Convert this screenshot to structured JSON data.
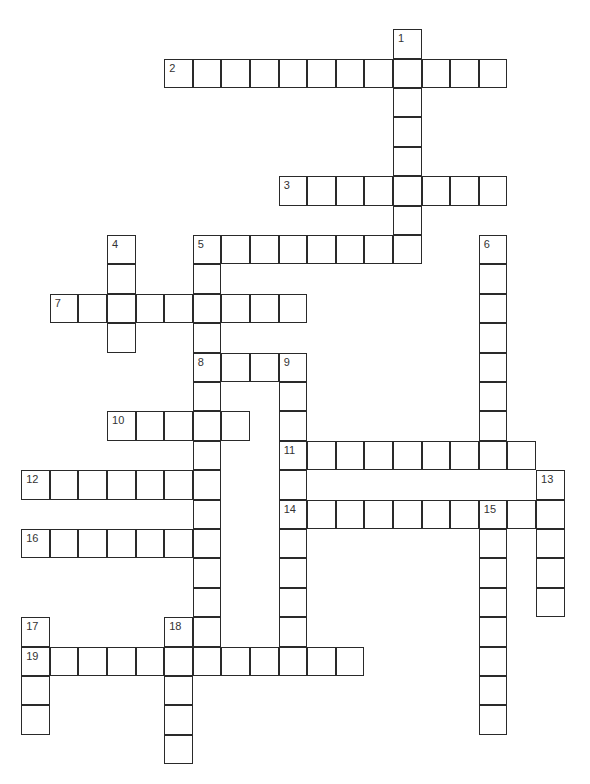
{
  "puzzle": {
    "type": "crossword",
    "entries": [
      {
        "number": "1",
        "direction": "down",
        "row": 0,
        "col": 13,
        "length": 8
      },
      {
        "number": "2",
        "direction": "across",
        "row": 1,
        "col": 5,
        "length": 12
      },
      {
        "number": "3",
        "direction": "across",
        "row": 5,
        "col": 9,
        "length": 8
      },
      {
        "number": "4",
        "direction": "down",
        "row": 7,
        "col": 3,
        "length": 4
      },
      {
        "number": "5",
        "direction": "across",
        "row": 7,
        "col": 6,
        "length": 8
      },
      {
        "number": "5",
        "direction": "down",
        "row": 7,
        "col": 6,
        "length": 14
      },
      {
        "number": "6",
        "direction": "down",
        "row": 7,
        "col": 16,
        "length": 8
      },
      {
        "number": "7",
        "direction": "across",
        "row": 9,
        "col": 1,
        "length": 9
      },
      {
        "number": "8",
        "direction": "across",
        "row": 11,
        "col": 6,
        "length": 4
      },
      {
        "number": "9",
        "direction": "down",
        "row": 11,
        "col": 9,
        "length": 10
      },
      {
        "number": "10",
        "direction": "across",
        "row": 13,
        "col": 3,
        "length": 5
      },
      {
        "number": "11",
        "direction": "across",
        "row": 14,
        "col": 9,
        "length": 9
      },
      {
        "number": "12",
        "direction": "across",
        "row": 15,
        "col": 0,
        "length": 7
      },
      {
        "number": "13",
        "direction": "down",
        "row": 15,
        "col": 18,
        "length": 5
      },
      {
        "number": "14",
        "direction": "across",
        "row": 16,
        "col": 9,
        "length": 10
      },
      {
        "number": "15",
        "direction": "down",
        "row": 16,
        "col": 16,
        "length": 8
      },
      {
        "number": "16",
        "direction": "across",
        "row": 17,
        "col": 0,
        "length": 7
      },
      {
        "number": "17",
        "direction": "down",
        "row": 20,
        "col": 0,
        "length": 4
      },
      {
        "number": "18",
        "direction": "down",
        "row": 20,
        "col": 5,
        "length": 5
      },
      {
        "number": "19",
        "direction": "across",
        "row": 21,
        "col": 0,
        "length": 12
      }
    ]
  }
}
